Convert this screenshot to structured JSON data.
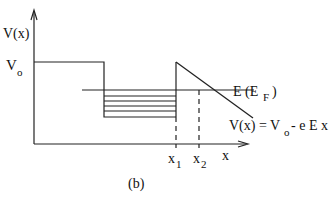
{
  "labels": {
    "y_axis": "V(x)",
    "v0": "V",
    "v0_sub": "o",
    "fermi": "E (E",
    "fermi_sub": "F",
    "fermi_close": ")",
    "potential_lhs": "V(x) = V",
    "potential_sub": "o",
    "potential_rhs": "- e  E x",
    "x_axis": "x",
    "x1": "x",
    "x1_sub": "1",
    "x2": "x",
    "x2_sub": "2",
    "caption": "(b)"
  }
}
